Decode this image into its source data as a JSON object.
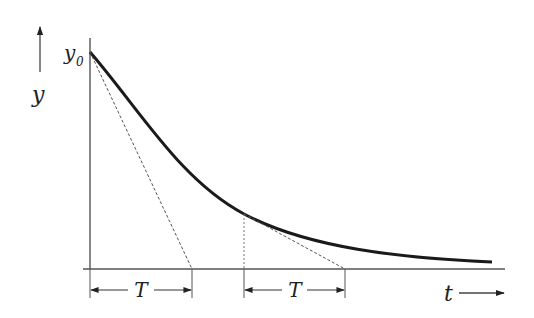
{
  "diagram": {
    "labels": {
      "y_axis": "y",
      "y0": "y",
      "y0_sub": "0",
      "t_axis": "t",
      "T1": "T",
      "T2": "T"
    },
    "colors": {
      "curve": "#1a1a1a",
      "axis": "#555555",
      "dashed": "#555555",
      "text": "#222222"
    }
  }
}
